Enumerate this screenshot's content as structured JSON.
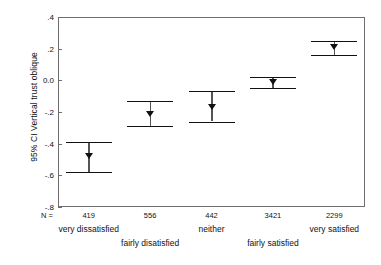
{
  "chart_data": {
    "type": "scatter",
    "title": "",
    "subtitle": "",
    "xlabel": "",
    "ylabel": "95% CI Vertical trust oblique",
    "ylim": [
      -0.8,
      0.4
    ],
    "yticks": [
      0.4,
      0.2,
      0.0,
      -0.2,
      -0.4,
      -0.6,
      -0.8
    ],
    "ytick_labels": [
      ".4",
      ".2",
      "0.0",
      "-.2",
      "-.4",
      "-.6",
      "-.8"
    ],
    "grid": false,
    "legend": "none",
    "n_prefix": "N =",
    "categories": [
      "very dissatisfied",
      "fairly disatisfied",
      "neither",
      "fairly satisfied",
      "very satisfied"
    ],
    "category_rows": [
      0,
      1,
      0,
      1,
      0
    ],
    "n_values": [
      "419",
      "556",
      "442",
      "3421",
      "2299"
    ],
    "means": [
      -0.48,
      -0.21,
      -0.17,
      -0.01,
      0.21
    ],
    "ci_lower": [
      -0.58,
      -0.29,
      -0.26,
      -0.05,
      0.16
    ],
    "ci_upper": [
      -0.39,
      -0.13,
      -0.07,
      0.02,
      0.25
    ],
    "series": [
      {
        "name": "Vertical trust oblique",
        "points": [
          {
            "category": "very dissatisfied",
            "n": "419",
            "mean": -0.48,
            "ci_lower": -0.58,
            "ci_upper": -0.39
          },
          {
            "category": "fairly disatisfied",
            "n": "556",
            "mean": -0.21,
            "ci_lower": -0.29,
            "ci_upper": -0.13
          },
          {
            "category": "neither",
            "n": "442",
            "mean": -0.17,
            "ci_lower": -0.26,
            "ci_upper": -0.07
          },
          {
            "category": "fairly satisfied",
            "n": "3421",
            "mean": -0.01,
            "ci_lower": -0.05,
            "ci_upper": 0.02
          },
          {
            "category": "very satisfied",
            "n": "2299",
            "mean": 0.21,
            "ci_lower": 0.16,
            "ci_upper": 0.25
          }
        ]
      }
    ],
    "colors": {
      "marker": "#111111",
      "cap": "#111111",
      "whisker": "#555555",
      "frame": "#6e6e6e",
      "background": "#ffffff",
      "text": "#111111"
    }
  }
}
